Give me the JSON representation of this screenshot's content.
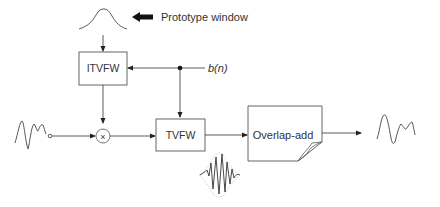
{
  "diagram": {
    "prototype_label": "Prototype window",
    "signal_label": "b(n)",
    "blocks": {
      "itvfw": "ITVFW",
      "tvfw": "TVFW",
      "overlap_add": "Overlap-add"
    },
    "multiply_symbol": "×",
    "colors": {
      "line": "#333333",
      "block_border": "#555555",
      "arrow_fill": "#1a1a1a"
    }
  }
}
